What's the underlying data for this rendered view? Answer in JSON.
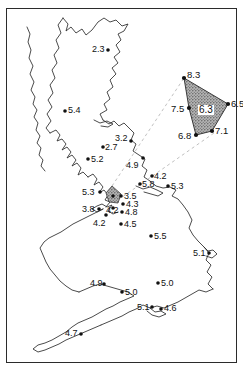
{
  "chart_data": {
    "type": "scatter",
    "title": "",
    "subtitle": "",
    "xlabel": "",
    "ylabel": "",
    "grid": false,
    "legend": null,
    "basemap": "Great Britain outline",
    "value_unit": "",
    "points": [
      {
        "label": "2.3",
        "x": 108,
        "y": 50,
        "lx": 92,
        "ly": 45,
        "marker": true
      },
      {
        "label": "5.4",
        "x": 65,
        "y": 111,
        "lx": 68,
        "ly": 106,
        "marker": true
      },
      {
        "label": "2.7",
        "x": 103,
        "y": 147,
        "lx": 105,
        "ly": 143,
        "marker": true
      },
      {
        "label": "3.2",
        "x": 131,
        "y": 141,
        "lx": 115,
        "ly": 134,
        "marker": true
      },
      {
        "label": "5.2",
        "x": 88,
        "y": 159,
        "lx": 91,
        "ly": 155,
        "marker": true
      },
      {
        "label": "4.9",
        "x": 143,
        "y": 158,
        "lx": 126,
        "ly": 161,
        "marker": true
      },
      {
        "label": "5.3",
        "x": 100,
        "y": 192,
        "lx": 82,
        "ly": 188,
        "marker": true
      },
      {
        "label": "5.8",
        "x": 140,
        "y": 184,
        "lx": 142,
        "ly": 180,
        "marker": true
      },
      {
        "label": "4.2",
        "x": 152,
        "y": 176,
        "lx": 154,
        "ly": 172,
        "marker": true
      },
      {
        "label": "5.3",
        "x": 168,
        "y": 186,
        "lx": 171,
        "ly": 182,
        "marker": true
      },
      {
        "label": "3.5",
        "x": 121,
        "y": 196,
        "lx": 124,
        "ly": 192,
        "marker": true
      },
      {
        "label": "4.3",
        "x": 123,
        "y": 204,
        "lx": 126,
        "ly": 200,
        "marker": true
      },
      {
        "label": "4.2",
        "x": 113,
        "y": 208,
        "lx": 106,
        "ly": 206,
        "marker": true
      },
      {
        "label": "3.8",
        "x": 99,
        "y": 209,
        "lx": 82,
        "ly": 205,
        "marker": true
      },
      {
        "label": "4.8",
        "x": 122,
        "y": 212,
        "lx": 125,
        "ly": 208,
        "marker": true
      },
      {
        "label": "4.2",
        "x": 106,
        "y": 215,
        "lx": 93,
        "ly": 219,
        "marker": true
      },
      {
        "label": "4.5",
        "x": 121,
        "y": 224,
        "lx": 124,
        "ly": 220,
        "marker": true
      },
      {
        "label": "5.5",
        "x": 151,
        "y": 236,
        "lx": 154,
        "ly": 232,
        "marker": true
      },
      {
        "label": "5.1",
        "x": 209,
        "y": 253,
        "lx": 193,
        "ly": 249,
        "marker": true
      },
      {
        "label": "4.9",
        "x": 104,
        "y": 284,
        "lx": 90,
        "ly": 279,
        "marker": true
      },
      {
        "label": "5.0",
        "x": 122,
        "y": 292,
        "lx": 125,
        "ly": 288,
        "marker": true
      },
      {
        "label": "5.0",
        "x": 158,
        "y": 283,
        "lx": 161,
        "ly": 279,
        "marker": true
      },
      {
        "label": "5.1",
        "x": 152,
        "y": 307,
        "lx": 137,
        "ly": 303,
        "marker": true
      },
      {
        "label": "4.6",
        "x": 161,
        "y": 309,
        "lx": 164,
        "ly": 304,
        "marker": true
      },
      {
        "label": "4.7",
        "x": 81,
        "y": 334,
        "lx": 65,
        "ly": 329,
        "marker": true
      }
    ],
    "inset": {
      "note": "magnified detail of shaded region in NW England",
      "center_label": "6.3",
      "vertices": [
        {
          "label": "8.3",
          "x": 184,
          "y": 78,
          "lx": 187,
          "ly": 70
        },
        {
          "label": "6.5",
          "x": 228,
          "y": 104,
          "lx": 231,
          "ly": 99
        },
        {
          "label": "7.1",
          "x": 212,
          "y": 131,
          "lx": 215,
          "ly": 126
        },
        {
          "label": "6.8",
          "x": 196,
          "y": 135,
          "lx": 178,
          "ly": 131
        },
        {
          "label": "7.5",
          "x": 189,
          "y": 108,
          "lx": 171,
          "ly": 104
        }
      ]
    },
    "colors": {
      "coastline": "#2b2b2b",
      "frame": "#2b2b2b",
      "marker": "#111111",
      "inset_fill": "#9a9a9a",
      "leader_line": "#aaaaaa",
      "background": "#ffffff"
    }
  }
}
